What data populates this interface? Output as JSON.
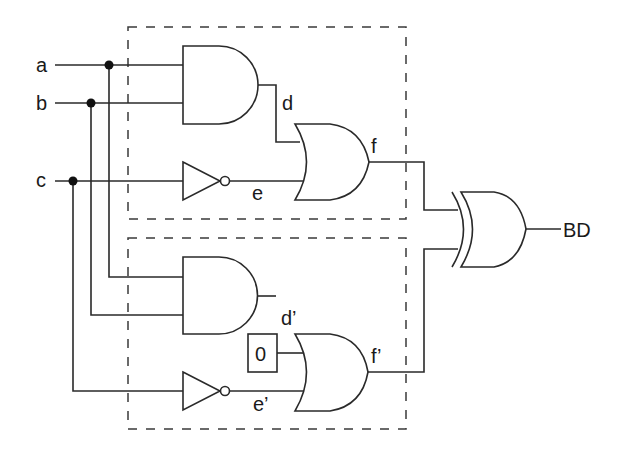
{
  "diagram": {
    "type": "logic-circuit",
    "inputs": [
      {
        "id": "a",
        "label": "a"
      },
      {
        "id": "b",
        "label": "b"
      },
      {
        "id": "c",
        "label": "c"
      }
    ],
    "signals": {
      "d": "d",
      "e": "e",
      "f": "f",
      "d_prime": "d’",
      "e_prime": "e’",
      "f_prime": "f’"
    },
    "constant": {
      "label": "0"
    },
    "output": {
      "label": "BD"
    },
    "gates": [
      {
        "id": "and1",
        "type": "AND",
        "inputs": [
          "a",
          "b"
        ],
        "output": "d"
      },
      {
        "id": "not1",
        "type": "NOT",
        "inputs": [
          "c"
        ],
        "output": "e"
      },
      {
        "id": "or1",
        "type": "OR",
        "inputs": [
          "d",
          "e"
        ],
        "output": "f"
      },
      {
        "id": "and2",
        "type": "AND",
        "inputs": [
          "a",
          "b"
        ],
        "output": "d’ (unconnected)"
      },
      {
        "id": "not2",
        "type": "NOT",
        "inputs": [
          "c"
        ],
        "output": "e’"
      },
      {
        "id": "or2",
        "type": "OR",
        "inputs": [
          "0",
          "e’"
        ],
        "output": "f’"
      },
      {
        "id": "xor",
        "type": "XOR",
        "inputs": [
          "f",
          "f’"
        ],
        "output": "BD"
      }
    ],
    "regions": [
      {
        "id": "good-circuit",
        "style": "dashed",
        "contains": [
          "and1",
          "not1",
          "or1"
        ]
      },
      {
        "id": "faulty-circuit",
        "style": "dashed",
        "contains": [
          "and2",
          "not2",
          "or2"
        ]
      }
    ]
  }
}
